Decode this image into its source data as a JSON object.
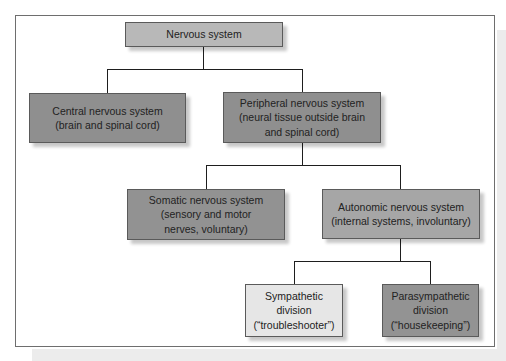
{
  "diagram": {
    "type": "hierarchy",
    "colors": {
      "frame_border": "#6e6e6e",
      "connector": "#1e1e1e",
      "root_fill": "#b8b8b8",
      "level1_fill": "#8f8f8f",
      "somatic_fill": "#929292",
      "autonomic_fill": "#a6a6a6",
      "sympathetic_fill": "#e6e6e6",
      "parasympathetic_fill": "#939393"
    },
    "nodes": {
      "root": {
        "lines": [
          "Nervous system"
        ]
      },
      "central": {
        "lines": [
          "Central nervous system",
          "(brain and spinal cord)"
        ]
      },
      "peripheral": {
        "lines": [
          "Peripheral nervous system",
          "(neural tissue outside brain",
          "and spinal cord)"
        ]
      },
      "somatic": {
        "lines": [
          "Somatic nervous system",
          "(sensory and motor",
          "nerves, voluntary)"
        ]
      },
      "autonomic": {
        "lines": [
          "Autonomic nervous system",
          "(internal systems, involuntary)"
        ]
      },
      "sympathetic": {
        "lines": [
          "Sympathetic",
          "division",
          "(“troubleshooter”)"
        ]
      },
      "parasympathetic": {
        "lines": [
          "Parasympathetic",
          "division",
          "(“housekeeping”)"
        ]
      }
    },
    "edges": [
      [
        "Nervous system",
        "Central nervous system"
      ],
      [
        "Nervous system",
        "Peripheral nervous system"
      ],
      [
        "Peripheral nervous system",
        "Somatic nervous system"
      ],
      [
        "Peripheral nervous system",
        "Autonomic nervous system"
      ],
      [
        "Autonomic nervous system",
        "Sympathetic division"
      ],
      [
        "Autonomic nervous system",
        "Parasympathetic division"
      ]
    ]
  }
}
